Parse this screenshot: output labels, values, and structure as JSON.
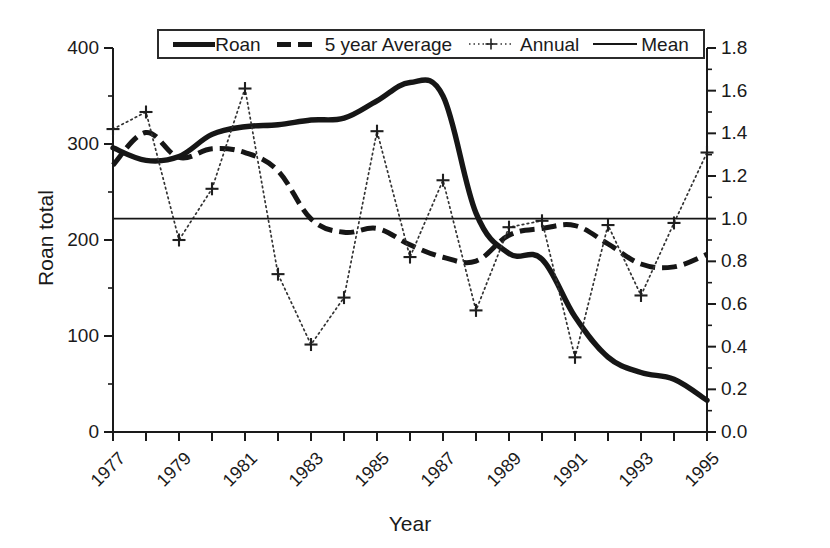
{
  "chart_data": {
    "type": "line",
    "title": "",
    "xlabel": "Year",
    "ylabel_left": "Roan total",
    "ylabel_right": "Rainfall/mean",
    "grid": false,
    "legend_position": "top",
    "x": [
      1977,
      1978,
      1979,
      1980,
      1981,
      1982,
      1983,
      1984,
      1985,
      1986,
      1987,
      1988,
      1989,
      1990,
      1991,
      1992,
      1993,
      1994,
      1995
    ],
    "xlim": [
      1977,
      1995
    ],
    "xticks_major": [
      1977,
      1979,
      1981,
      1983,
      1985,
      1987,
      1989,
      1991,
      1993,
      1995
    ],
    "xtick_labels": [
      "1977",
      "1979",
      "1981",
      "1983",
      "1985",
      "1987",
      "1989",
      "1991",
      "1993",
      "1995"
    ],
    "ylim_left": [
      0,
      400
    ],
    "yticks_left": [
      0,
      100,
      200,
      300,
      400
    ],
    "ytick_labels_left": [
      "0",
      "100",
      "200",
      "300",
      "400"
    ],
    "yminor_left": [
      50,
      150,
      250,
      350
    ],
    "ylim_right": [
      0.0,
      1.8
    ],
    "yticks_right": [
      0.0,
      0.2,
      0.4,
      0.6,
      0.8,
      1.0,
      1.2,
      1.4,
      1.6,
      1.8
    ],
    "ytick_labels_right": [
      "0.0",
      "0.2",
      "0.4",
      "0.6",
      "0.8",
      "1.0",
      "1.2",
      "1.4",
      "1.6",
      "1.8"
    ],
    "yminor_right": [
      0.1,
      0.3,
      0.5,
      0.7,
      0.9,
      1.1,
      1.3,
      1.5,
      1.7
    ],
    "series": [
      {
        "name": "Roan",
        "axis": "left",
        "style": "solid-thick",
        "color": "#161616",
        "values": [
          296,
          283,
          287,
          310,
          318,
          320,
          325,
          327,
          345,
          364,
          350,
          228,
          186,
          180,
          120,
          78,
          62,
          55,
          33
        ]
      },
      {
        "name": "5 year Average",
        "axis": "left",
        "style": "dashed",
        "color": "#161616",
        "values": [
          278,
          312,
          286,
          295,
          291,
          272,
          222,
          208,
          212,
          195,
          182,
          178,
          205,
          212,
          215,
          196,
          175,
          172,
          185
        ]
      },
      {
        "name": "Annual",
        "axis": "right",
        "style": "dotted-plus",
        "color": "#333333",
        "values": [
          1.42,
          1.5,
          0.9,
          1.14,
          1.61,
          0.74,
          0.41,
          0.63,
          1.41,
          0.82,
          1.18,
          0.57,
          0.96,
          0.99,
          0.35,
          0.97,
          0.64,
          0.98,
          1.31
        ]
      },
      {
        "name": "Mean",
        "axis": "right",
        "style": "solid-thin",
        "color": "#161616",
        "constant_value": 1.0,
        "values": [
          1.0,
          1.0,
          1.0,
          1.0,
          1.0,
          1.0,
          1.0,
          1.0,
          1.0,
          1.0,
          1.0,
          1.0,
          1.0,
          1.0,
          1.0,
          1.0,
          1.0,
          1.0,
          1.0
        ]
      }
    ]
  },
  "legend": {
    "entries": [
      {
        "label": "Roan",
        "swatch": "solid-thick-line-icon"
      },
      {
        "label": "5 year Average",
        "swatch": "dashed-line-icon"
      },
      {
        "label": "Annual",
        "swatch": "dotted-plus-line-icon"
      },
      {
        "label": "Mean",
        "swatch": "solid-thin-line-icon"
      }
    ]
  },
  "axes": {
    "x_title": "Year",
    "y_left_title": "Roan total",
    "y_right_title": "Rainfall/mean"
  }
}
